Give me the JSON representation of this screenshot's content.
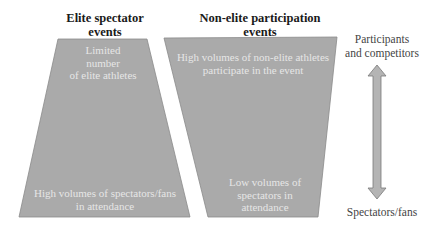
{
  "diagram": {
    "colors": {
      "shape_fill": "#aaaaaa",
      "shape_stroke": "#8a8a8a",
      "inner_text": "#e6e6e6",
      "heading_text": "#1a1a1a",
      "label_text": "#444444",
      "arrow_fill": "#b4b4b4",
      "arrow_stroke": "#7a7a7a"
    },
    "elite": {
      "heading_line1": "Elite spectator",
      "heading_line2": "events",
      "top_text_line1": "Limited",
      "top_text_line2": "number",
      "top_text_line3": "of elite athletes",
      "bottom_text_line1": "High volumes of spectators/fans",
      "bottom_text_line2": "in attendance"
    },
    "nonelite": {
      "heading_line1": "Non-elite participation",
      "heading_line2": "events",
      "top_text_line1": "High volumes of non-elite athletes",
      "top_text_line2": "participate in the event",
      "bottom_text_line1": "Low volumes of",
      "bottom_text_line2": "spectators in",
      "bottom_text_line3": "attendance"
    },
    "axis": {
      "top_label_line1": "Participants",
      "top_label_line2": "and competitors",
      "bottom_label": "Spectators/fans",
      "arrow": "double-vertical-arrow"
    }
  }
}
